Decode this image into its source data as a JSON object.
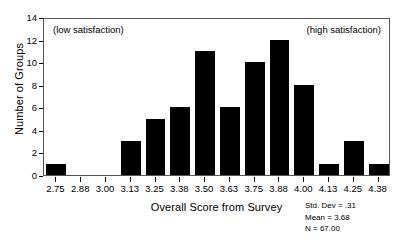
{
  "chart_data": {
    "type": "bar",
    "title": "",
    "xlabel": "Overall Score from Survey",
    "ylabel": "Number of Groups",
    "categories": [
      "2.75",
      "2.88",
      "3.00",
      "3.13",
      "3.25",
      "3.38",
      "3.50",
      "3.63",
      "3.75",
      "3.88",
      "4.00",
      "4.13",
      "4.25",
      "4.38"
    ],
    "values": [
      1,
      0,
      0,
      3,
      5,
      6,
      11,
      6,
      10,
      12,
      8,
      1,
      3,
      1
    ],
    "ylim": [
      0,
      14
    ],
    "ytick_labels": [
      "0",
      "2",
      "4",
      "6",
      "8",
      "10",
      "12",
      "14"
    ],
    "ytick_values": [
      0,
      2,
      4,
      6,
      8,
      10,
      12,
      14
    ],
    "grid": false,
    "legend": null,
    "annotations": [
      {
        "text": "(low satisfaction)",
        "position": "top-left-inside-plot"
      },
      {
        "text": "(high satisfaction)",
        "position": "top-right-inside-plot"
      }
    ],
    "bar_color": "#000000",
    "frame_color": "#555555"
  },
  "stats": {
    "std_dev": "Std. Dev = .31",
    "mean": "Mean = 3.68",
    "n": "N = 67.00"
  }
}
